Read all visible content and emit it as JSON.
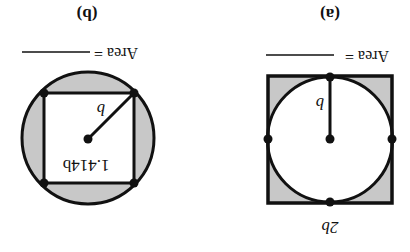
{
  "orientation": "rotated-180",
  "colors": {
    "stroke": "#111111",
    "shade": "#c8c8c8",
    "background": "#ffffff"
  },
  "figures": [
    {
      "id": "a",
      "caption": "(a)",
      "area_label": "Area =",
      "description": "Circle of radius b inscribed in a square of side 2b; corner regions shaded",
      "radius_label": "b",
      "side_label": "2b"
    },
    {
      "id": "b",
      "caption": "(b)",
      "area_label": "Area =",
      "description": "Square of side 1.414b inscribed in a circle of radius b; segments outside square shaded",
      "radius_label": "b",
      "side_label": "1.414b"
    }
  ]
}
